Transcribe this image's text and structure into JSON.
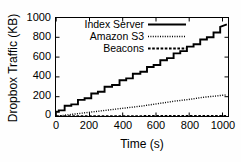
{
  "chart_data": {
    "type": "line",
    "title": "",
    "xlabel": "Time (s)",
    "ylabel": "Dropbox Traffic (KB)",
    "xlim": [
      0,
      1040
    ],
    "ylim": [
      0,
      1000
    ],
    "xticks": [
      0,
      200,
      400,
      600,
      800,
      1000
    ],
    "yticks": [
      0,
      200,
      400,
      600,
      800,
      1000
    ],
    "grid": false,
    "legend_position": "top-left-inside",
    "series": [
      {
        "name": "Index Server",
        "style": "solid",
        "x": [
          0,
          0,
          20,
          20,
          55,
          55,
          95,
          95,
          135,
          135,
          175,
          175,
          215,
          215,
          255,
          255,
          295,
          295,
          340,
          340,
          385,
          385,
          425,
          425,
          465,
          465,
          510,
          510,
          550,
          550,
          590,
          590,
          630,
          630,
          670,
          670,
          710,
          710,
          750,
          750,
          790,
          790,
          830,
          830,
          870,
          870,
          910,
          910,
          950,
          950,
          990,
          990,
          1030
        ],
        "y": [
          0,
          48,
          48,
          62,
          62,
          108,
          108,
          122,
          122,
          168,
          168,
          185,
          185,
          232,
          232,
          250,
          250,
          300,
          300,
          318,
          318,
          366,
          366,
          385,
          385,
          432,
          432,
          452,
          452,
          500,
          500,
          520,
          520,
          568,
          568,
          590,
          590,
          638,
          638,
          660,
          660,
          706,
          706,
          730,
          730,
          778,
          778,
          800,
          800,
          848,
          848,
          905,
          930
        ]
      },
      {
        "name": "Amazon S3",
        "style": "dotted",
        "x": [
          0,
          40,
          80,
          120,
          160,
          200,
          240,
          280,
          320,
          360,
          400,
          440,
          480,
          520,
          560,
          600,
          640,
          680,
          720,
          760,
          800,
          840,
          880,
          920,
          960,
          1000,
          1030
        ],
        "y": [
          2,
          10,
          18,
          26,
          34,
          42,
          50,
          58,
          66,
          74,
          82,
          90,
          98,
          106,
          116,
          126,
          136,
          146,
          156,
          164,
          172,
          182,
          192,
          200,
          206,
          214,
          218
        ]
      },
      {
        "name": "Beacons",
        "style": "dashed",
        "x": [
          0,
          100,
          200,
          300,
          400,
          500,
          600,
          700,
          800,
          900,
          1000,
          1030
        ],
        "y": [
          3,
          4,
          4,
          5,
          5,
          5,
          6,
          6,
          6,
          7,
          7,
          7
        ]
      }
    ]
  },
  "axes": {
    "ylabel": "Dropbox Traffic (KB)",
    "xlabel": "Time (s)",
    "yticks": [
      "1000",
      "800",
      "600",
      "400",
      "200",
      "0"
    ],
    "xticks": [
      "0",
      "200",
      "400",
      "600",
      "800",
      "1000"
    ]
  },
  "legend": {
    "items": [
      {
        "label": "Index Server",
        "style": "solid"
      },
      {
        "label": "Amazon S3",
        "style": "dotted"
      },
      {
        "label": "Beacons",
        "style": "dashed"
      }
    ]
  }
}
